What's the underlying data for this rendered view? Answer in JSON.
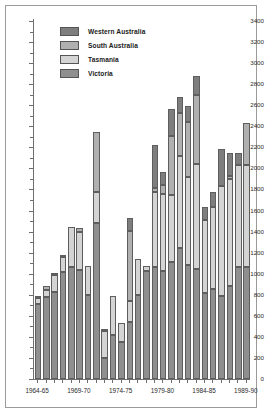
{
  "chart_data": {
    "type": "bar",
    "subtype": "stacked-vertical",
    "title": "",
    "subtitle": "",
    "xlabel": "",
    "ylabel": "",
    "ylim": [
      0,
      3400
    ],
    "ytick_step": 200,
    "ytick_minor_step": 100,
    "grid": false,
    "legend_position": "top-left-inside",
    "categories": [
      "1964-65",
      "1965-66",
      "1966-67",
      "1967-68",
      "1968-69",
      "1969-70",
      "1970-71",
      "1971-72",
      "1972-73",
      "1973-74",
      "1974-75",
      "1975-76",
      "1976-77",
      "1977-78",
      "1978-79",
      "1979-80",
      "1980-81",
      "1981-82",
      "1982-83",
      "1983-84",
      "1984-85",
      "1985-86",
      "1986-87",
      "1987-88",
      "1988-89",
      "1989-90"
    ],
    "xtick_labels": [
      "1964-65",
      "1969-70",
      "1974-75",
      "1979-80",
      "1984-85",
      "1989-90"
    ],
    "xtick_label_indices": [
      0,
      5,
      10,
      15,
      20,
      25
    ],
    "series": [
      {
        "name": "Victoria",
        "color": "#8f8f8f",
        "values": [
          710,
          780,
          830,
          1020,
          1060,
          1040,
          800,
          1480,
          195,
          415,
          355,
          540,
          800,
          1030,
          1060,
          1030,
          1110,
          1240,
          1080,
          1045,
          820,
          855,
          790,
          880,
          1060,
          1060
        ]
      },
      {
        "name": "Tasmania",
        "color": "#d4d4d4",
        "values": [
          60,
          70,
          160,
          135,
          380,
          360,
          275,
          295,
          260,
          370,
          180,
          200,
          340,
          45,
          715,
          730,
          640,
          880,
          840,
          995,
          690,
          780,
          1040,
          1015,
          975,
          975
        ]
      },
      {
        "name": "South Australia",
        "color": "#b0b0b0",
        "values": [
          20,
          30,
          10,
          5,
          0,
          35,
          0,
          570,
          15,
          0,
          0,
          670,
          0,
          0,
          40,
          80,
          555,
          410,
          520,
          660,
          0,
          0,
          0,
          30,
          0,
          395
        ]
      },
      {
        "name": "Western Australia",
        "color": "#7e7e7e",
        "values": [
          0,
          0,
          0,
          0,
          0,
          0,
          0,
          0,
          0,
          0,
          0,
          120,
          0,
          0,
          410,
          125,
          255,
          150,
          150,
          180,
          120,
          140,
          350,
          225,
          115,
          0
        ]
      }
    ],
    "totals": [
      790,
      880,
      1000,
      1160,
      1440,
      1435,
      1075,
      2345,
      470,
      785,
      535,
      1530,
      1140,
      1075,
      2225,
      1965,
      2420,
      2680,
      2590,
      2880,
      1630,
      1775,
      2180,
      2150,
      2150,
      2430
    ]
  },
  "legend": {
    "items": [
      {
        "label": "Western Australia"
      },
      {
        "label": "South Australia"
      },
      {
        "label": "Tasmania"
      },
      {
        "label": "Victoria"
      }
    ]
  },
  "yaxis": {
    "labels": [
      "3400",
      "3200",
      "3000",
      "2800",
      "2600",
      "2400",
      "2200",
      "2000",
      "1800",
      "1600",
      "1400",
      "1200",
      "1000",
      "800",
      "600",
      "400",
      "200",
      "0"
    ]
  }
}
